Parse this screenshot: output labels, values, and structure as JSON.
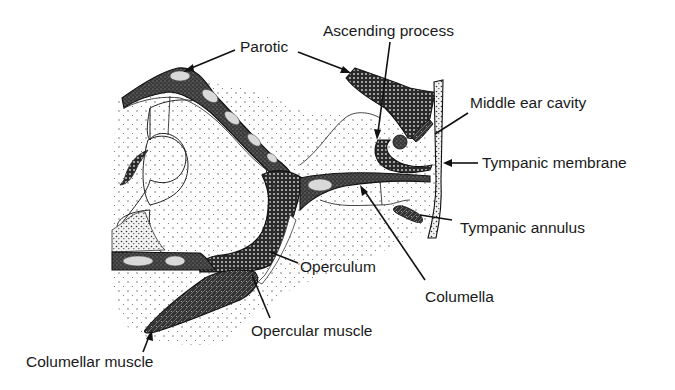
{
  "figure": {
    "colors": {
      "ink": "#111111",
      "background": "#ffffff",
      "bone_fill": "#3a3a3a",
      "tissue_fill": "#f4f4f4"
    },
    "labels": [
      {
        "id": "parotic",
        "text": "Parotic"
      },
      {
        "id": "ascending-process",
        "text": "Ascending process"
      },
      {
        "id": "middle-ear-cavity",
        "text": "Middle ear cavity"
      },
      {
        "id": "tympanic-membrane",
        "text": "Tympanic membrane"
      },
      {
        "id": "tympanic-annulus",
        "text": "Tympanic annulus"
      },
      {
        "id": "operculum",
        "text": "Operculum"
      },
      {
        "id": "columella",
        "text": "Columella"
      },
      {
        "id": "opercular-muscle",
        "text": "Opercular muscle"
      },
      {
        "id": "columellar-muscle",
        "text": "Columellar muscle"
      }
    ]
  }
}
